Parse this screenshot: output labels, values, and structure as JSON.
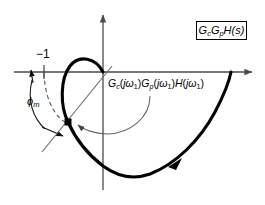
{
  "figure": {
    "type": "nyquist-plot",
    "title_box": {
      "text": "GcGpH(s)",
      "parts": {
        "g": "G",
        "c": "c",
        "p": "p",
        "h": "H",
        "s": "(s)"
      }
    },
    "labels": {
      "critical_point": "−1",
      "phase_margin": "ϕm",
      "phase_margin_base": "ϕ",
      "phase_margin_sub": "m",
      "operating_point": "Gc(jω1)Gp(jω1)H(jω1)",
      "operating_point_parts": {
        "g": "G",
        "c": "c",
        "p": "p",
        "h": "H",
        "open": "(",
        "close": ")",
        "j": "j",
        "omega": "ω",
        "one": "1"
      }
    },
    "axes": {
      "real_axis_label": "real-axis",
      "imag_axis_label": "imaginary-axis",
      "origin": {
        "x": 103,
        "y": 72
      }
    },
    "markers": {
      "operating_point_marker": "square-marker",
      "critical_point_tick": "minus-one-tick"
    },
    "colors": {
      "curve": "#000000",
      "axis": "#4a4a4a",
      "thin_line": "#6b6b6b",
      "background": "#ffffff",
      "box_border": "#000000"
    }
  }
}
